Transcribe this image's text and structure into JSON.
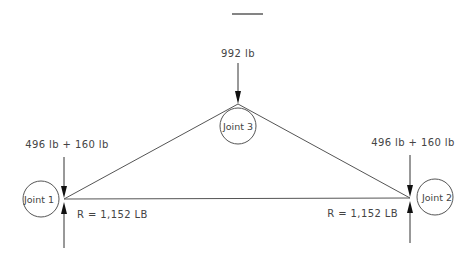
{
  "diagram": {
    "type": "truss free-body diagram",
    "title_underline": true,
    "members": [
      {
        "name": "left-top-chord",
        "from": "Joint 1",
        "to": "Joint 3"
      },
      {
        "name": "right-top-chord",
        "from": "Joint 3",
        "to": "Joint 2"
      },
      {
        "name": "bottom-chord",
        "from": "Joint 1",
        "to": "Joint 2"
      }
    ],
    "joints": [
      {
        "id": 1,
        "label": "Joint 1"
      },
      {
        "id": 2,
        "label": "Joint 2"
      },
      {
        "id": 3,
        "label": "Joint 3"
      }
    ],
    "loads": {
      "apex": "992 lb",
      "left_support_load": "496 lb + 160 lb",
      "right_support_load": "496 lb + 160 lb"
    },
    "reactions": {
      "left": "R = 1,152 LB",
      "right": "R = 1,152 LB"
    }
  }
}
